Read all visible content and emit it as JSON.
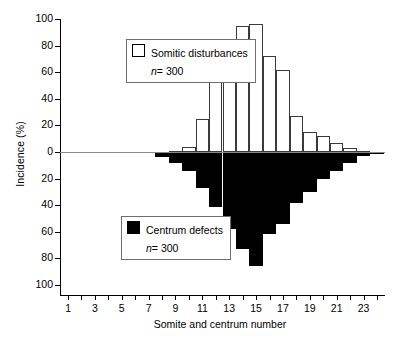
{
  "chart_data": {
    "type": "bar",
    "title": "",
    "xlabel": "Somite and centrum number",
    "ylabel": "Incidence (%)",
    "grid": false,
    "orientation": "diverging-vertical",
    "ylim": [
      -100,
      100
    ],
    "yticks_up": [
      "0",
      "20",
      "40",
      "60",
      "80",
      "100"
    ],
    "yticks_down": [
      "20",
      "40",
      "60",
      "80",
      "100"
    ],
    "xlim": [
      0.4,
      24.6
    ],
    "xticks_all": [
      1,
      2,
      3,
      4,
      5,
      6,
      7,
      8,
      9,
      10,
      11,
      12,
      13,
      14,
      15,
      16,
      17,
      18,
      19,
      20,
      21,
      22,
      23,
      24
    ],
    "xtick_labels": [
      "1",
      "",
      "3",
      "",
      "5",
      "",
      "7",
      "",
      "9",
      "",
      "11",
      "",
      "13",
      "",
      "15",
      "",
      "17",
      "",
      "19",
      "",
      "21",
      "",
      "23",
      ""
    ],
    "categories": [
      1,
      2,
      3,
      4,
      5,
      6,
      7,
      8,
      9,
      10,
      11,
      12,
      13,
      14,
      15,
      16,
      17,
      18,
      19,
      20,
      21,
      22,
      23,
      24
    ],
    "series": [
      {
        "name": "Somitic disturbances",
        "n_label": "n",
        "n_value": "= 300",
        "fill": "#ffffff",
        "edge": "#3a3a3a",
        "direction": "up",
        "values": [
          0,
          0,
          0,
          0,
          0,
          0,
          0,
          0,
          1,
          4,
          25,
          56,
          84,
          95,
          96,
          72,
          62,
          27,
          15,
          12,
          7,
          3,
          1,
          0
        ]
      },
      {
        "name": "Centrum defects",
        "n_label": "n",
        "n_value": "= 300",
        "fill": "#000000",
        "edge": "#000000",
        "direction": "down",
        "values": [
          0,
          0,
          0,
          0,
          0,
          0,
          0,
          4,
          8,
          14,
          27,
          41,
          58,
          73,
          86,
          62,
          54,
          38,
          30,
          20,
          14,
          8,
          3,
          1
        ]
      }
    ],
    "legend_position": "inside-upper-left / inside-lower-left"
  },
  "legends": {
    "top": {
      "label": "Somitic disturbances",
      "n_italic": "n",
      "n_rest": "= 300",
      "swatch": "open-square"
    },
    "bottom": {
      "label": "Centrum defects",
      "n_italic": "n",
      "n_rest": "= 300",
      "swatch": "filled-square"
    }
  }
}
